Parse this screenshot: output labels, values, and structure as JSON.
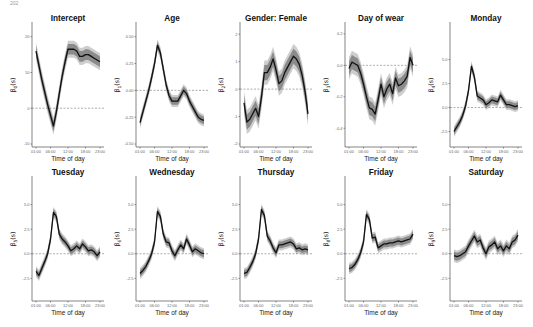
{
  "page": {
    "page_number": "202",
    "running_head": ""
  },
  "chart_data": [
    {
      "type": "line",
      "title": "Intercept",
      "ylabel": "β0(s)",
      "ysub": "0",
      "xlabel": "Time of day",
      "xticks": [
        "01:00",
        "06:00",
        "12:00",
        "18:00",
        "23:00"
      ],
      "ylim": [
        -10,
        23
      ],
      "yticks": [
        -10,
        0,
        10,
        20
      ],
      "ytick_labels": [
        "-10",
        "0",
        "10",
        "20"
      ],
      "zero_line": true,
      "x": [
        0,
        1,
        2,
        3,
        4,
        5,
        6,
        7,
        8,
        9,
        10,
        11,
        12,
        13,
        14,
        15,
        16,
        17,
        18,
        19,
        20,
        21,
        22
      ],
      "values": [
        16,
        12,
        8,
        4.5,
        1,
        -2,
        -5,
        -1,
        4,
        9,
        13,
        16.5,
        16.5,
        16.5,
        16,
        14.5,
        14.5,
        15,
        15,
        14.5,
        14,
        13.5,
        13
      ],
      "band": 3.0
    },
    {
      "type": "line",
      "title": "Age",
      "ylabel": "β1(s)",
      "ysub": "1",
      "xlabel": "Time of day",
      "xticks": [
        "01:00",
        "06:00",
        "12:00",
        "18:00",
        "23:00"
      ],
      "ylim": [
        -0.5,
        0.6
      ],
      "yticks": [
        -0.5,
        -0.25,
        0,
        0.25,
        0.5
      ],
      "ytick_labels": [
        "-0.50",
        "-0.25",
        "0.00",
        "0.25",
        "0.50"
      ],
      "zero_line": true,
      "x": [
        0,
        1,
        2,
        3,
        4,
        5,
        6,
        7,
        8,
        9,
        10,
        11,
        12,
        13,
        14,
        15,
        16,
        17,
        18,
        19,
        20,
        21,
        22
      ],
      "values": [
        -0.3,
        -0.2,
        -0.1,
        0.0,
        0.12,
        0.25,
        0.42,
        0.35,
        0.2,
        0.05,
        -0.05,
        -0.1,
        -0.1,
        -0.1,
        -0.05,
        0.0,
        -0.03,
        -0.1,
        -0.15,
        -0.2,
        -0.25,
        -0.27,
        -0.28
      ],
      "band": 0.07
    },
    {
      "type": "line",
      "title": "Gender: Female",
      "ylabel": "β2(s)",
      "ysub": "2",
      "xlabel": "Time of day",
      "xticks": [
        "01:00",
        "06:00",
        "12:00",
        "18:00",
        "23:00"
      ],
      "ylim": [
        -2,
        2.3
      ],
      "yticks": [
        -2,
        -1,
        0,
        1,
        2
      ],
      "ytick_labels": [
        "-2",
        "-1",
        "0",
        "1",
        "2"
      ],
      "zero_line": true,
      "x": [
        0,
        1,
        2,
        3,
        4,
        5,
        6,
        7,
        8,
        9,
        10,
        11,
        12,
        13,
        14,
        15,
        16,
        17,
        18,
        19,
        20,
        21,
        22
      ],
      "values": [
        -0.5,
        -1.2,
        -1.1,
        -0.9,
        -0.7,
        -1.0,
        -0.3,
        0.6,
        0.6,
        0.8,
        1.1,
        0.7,
        0.2,
        0.3,
        0.6,
        0.8,
        1.0,
        1.2,
        1.1,
        0.9,
        0.5,
        -0.1,
        -0.9
      ],
      "band": 0.55
    },
    {
      "type": "line",
      "title": "Day of wear",
      "ylabel": "β3(s)",
      "ysub": "3",
      "xlabel": "Time of day",
      "xticks": [
        "01:00",
        "06:00",
        "12:00",
        "18:00",
        "23:00"
      ],
      "ylim": [
        -0.5,
        0.25
      ],
      "yticks": [
        -0.4,
        -0.2,
        0,
        0.2
      ],
      "ytick_labels": [
        "-0.4",
        "-0.2",
        "0.0",
        "0.2"
      ],
      "zero_line": true,
      "x": [
        0,
        1,
        2,
        3,
        4,
        5,
        6,
        7,
        8,
        9,
        10,
        11,
        12,
        13,
        14,
        15,
        16,
        17,
        18,
        19,
        20,
        21,
        22
      ],
      "values": [
        -0.02,
        0.02,
        0.01,
        0.0,
        -0.05,
        -0.12,
        -0.2,
        -0.27,
        -0.28,
        -0.31,
        -0.22,
        -0.12,
        -0.2,
        -0.15,
        -0.12,
        -0.18,
        -0.08,
        -0.13,
        -0.12,
        -0.1,
        -0.07,
        0.05,
        0.0
      ],
      "band": 0.09
    },
    {
      "type": "line",
      "title": "Monday",
      "ylabel": "β4(s)",
      "ysub": "4",
      "xlabel": "Time of day",
      "xticks": [
        "01:00",
        "06:00",
        "12:00",
        "18:00",
        "23:00"
      ],
      "ylim": [
        -3.8,
        8.5
      ],
      "yticks": [
        -2.5,
        0,
        2.5,
        5
      ],
      "ytick_labels": [
        "-2.5",
        "0.0",
        "2.5",
        "5.0"
      ],
      "zero_line": true,
      "x": [
        0,
        1,
        2,
        3,
        4,
        5,
        6,
        7,
        8,
        9,
        10,
        11,
        12,
        13,
        14,
        15,
        16,
        17,
        18,
        19,
        20,
        21,
        22
      ],
      "values": [
        -2.5,
        -2.0,
        -1.5,
        -0.8,
        0.2,
        1.8,
        4.3,
        3.2,
        1.2,
        1.0,
        0.8,
        0.3,
        0.5,
        0.8,
        0.7,
        0.6,
        1.3,
        0.8,
        0.3,
        0.3,
        0.2,
        0.1,
        0.2
      ],
      "band": 0.7
    },
    {
      "type": "line",
      "title": "Tuesday",
      "ylabel": "β5(s)",
      "ysub": "5",
      "xlabel": "Time of day",
      "xticks": [
        "01:00",
        "06:00",
        "12:00",
        "18:00",
        "23:00"
      ],
      "ylim": [
        -4.5,
        7.5
      ],
      "yticks": [
        -2.5,
        0,
        2.5,
        5
      ],
      "ytick_labels": [
        "-2.5",
        "0.0",
        "2.5",
        "5.0"
      ],
      "zero_line": true,
      "x": [
        0,
        1,
        2,
        3,
        4,
        5,
        6,
        7,
        8,
        9,
        10,
        11,
        12,
        13,
        14,
        15,
        16,
        17,
        18,
        19,
        20,
        21,
        22
      ],
      "values": [
        -1.8,
        -2.2,
        -1.5,
        -0.8,
        0.0,
        1.5,
        4.2,
        3.8,
        2.0,
        1.5,
        1.2,
        0.8,
        0.3,
        0.5,
        0.8,
        0.5,
        1.0,
        0.7,
        0.3,
        0.4,
        0.2,
        -0.2,
        0.2
      ],
      "band": 0.7
    },
    {
      "type": "line",
      "title": "Wednesday",
      "ylabel": "β6(s)",
      "ysub": "6",
      "xlabel": "Time of day",
      "xticks": [
        "01:00",
        "06:00",
        "12:00",
        "18:00",
        "23:00"
      ],
      "ylim": [
        -4.5,
        7.5
      ],
      "yticks": [
        -2.5,
        0,
        2.5,
        5
      ],
      "ytick_labels": [
        "-2.5",
        "0.0",
        "2.5",
        "5.0"
      ],
      "zero_line": true,
      "x": [
        0,
        1,
        2,
        3,
        4,
        5,
        6,
        7,
        8,
        9,
        10,
        11,
        12,
        13,
        14,
        15,
        16,
        17,
        18,
        19,
        20,
        21,
        22
      ],
      "values": [
        -2.0,
        -1.7,
        -1.3,
        -0.7,
        0.0,
        1.2,
        4.3,
        3.8,
        2.0,
        1.2,
        1.1,
        0.3,
        -0.2,
        0.4,
        0.9,
        0.5,
        1.5,
        0.9,
        0.2,
        0.5,
        0.3,
        0.1,
        0.0
      ],
      "band": 0.7
    },
    {
      "type": "line",
      "title": "Thursday",
      "ylabel": "β7(s)",
      "ysub": "7",
      "xlabel": "Time of day",
      "xticks": [
        "01:00",
        "06:00",
        "12:00",
        "18:00",
        "23:00"
      ],
      "ylim": [
        -4.5,
        7.5
      ],
      "yticks": [
        -2.5,
        0,
        2.5,
        5
      ],
      "ytick_labels": [
        "-2.5",
        "0.0",
        "2.5",
        "5.0"
      ],
      "zero_line": true,
      "x": [
        0,
        1,
        2,
        3,
        4,
        5,
        6,
        7,
        8,
        9,
        10,
        11,
        12,
        13,
        14,
        15,
        16,
        17,
        18,
        19,
        20,
        21,
        22
      ],
      "values": [
        -2.0,
        -1.9,
        -1.4,
        -0.8,
        0.0,
        1.5,
        4.5,
        3.9,
        1.8,
        1.3,
        0.6,
        0.1,
        0.9,
        0.9,
        1.0,
        1.1,
        1.2,
        1.0,
        0.5,
        0.6,
        0.4,
        0.5,
        0.4
      ],
      "band": 0.7
    },
    {
      "type": "line",
      "title": "Friday",
      "ylabel": "β8(s)",
      "ysub": "8",
      "xlabel": "Time of day",
      "xticks": [
        "01:00",
        "06:00",
        "12:00",
        "18:00",
        "23:00"
      ],
      "ylim": [
        -4.5,
        7.5
      ],
      "yticks": [
        -2.5,
        0,
        2.5,
        5
      ],
      "ytick_labels": [
        "-2.5",
        "0.0",
        "2.5",
        "5.0"
      ],
      "zero_line": true,
      "x": [
        0,
        1,
        2,
        3,
        4,
        5,
        6,
        7,
        8,
        9,
        10,
        11,
        12,
        13,
        14,
        15,
        16,
        17,
        18,
        19,
        20,
        21,
        22
      ],
      "values": [
        -1.5,
        -1.4,
        -1.1,
        -0.6,
        0.1,
        1.2,
        4.0,
        3.5,
        1.6,
        1.7,
        0.6,
        0.8,
        1.0,
        1.0,
        1.1,
        1.1,
        1.2,
        1.3,
        1.2,
        1.3,
        1.4,
        1.5,
        2.0
      ],
      "band": 0.7
    },
    {
      "type": "line",
      "title": "Saturday",
      "ylabel": "β9(s)",
      "ysub": "9",
      "xlabel": "Time of day",
      "xticks": [
        "01:00",
        "06:00",
        "12:00",
        "18:00",
        "23:00"
      ],
      "ylim": [
        -4.5,
        7.5
      ],
      "yticks": [
        -2.5,
        0,
        2.5,
        5
      ],
      "ytick_labels": [
        "-2.5",
        "0.0",
        "2.5",
        "5.0"
      ],
      "zero_line": true,
      "x": [
        0,
        1,
        2,
        3,
        4,
        5,
        6,
        7,
        8,
        9,
        10,
        11,
        12,
        13,
        14,
        15,
        16,
        17,
        18,
        19,
        20,
        21,
        22
      ],
      "values": [
        -0.2,
        -0.3,
        -0.2,
        0.0,
        0.2,
        0.8,
        1.3,
        1.8,
        1.2,
        1.4,
        0.6,
        0.0,
        0.7,
        0.9,
        1.2,
        0.5,
        0.8,
        0.3,
        0.8,
        0.5,
        1.2,
        1.4,
        1.9
      ],
      "band": 0.8
    }
  ]
}
